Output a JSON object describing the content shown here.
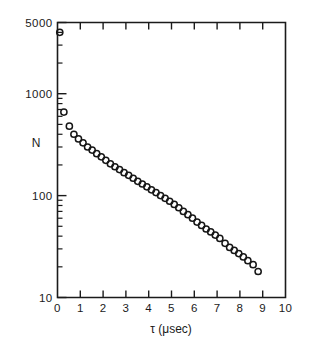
{
  "chart_data": {
    "type": "scatter",
    "title": "",
    "xlabel": "τ (μsec)",
    "ylabel": "N",
    "xlim": [
      0,
      10
    ],
    "ylim": [
      10,
      5000
    ],
    "yscale": "log",
    "xscale": "linear",
    "grid": false,
    "legend": null,
    "marker": "open-circle",
    "xticks": [
      0,
      1,
      2,
      3,
      4,
      5,
      6,
      7,
      8,
      9,
      10
    ],
    "xticklabels": [
      "0",
      "1",
      "2",
      "3",
      "4",
      "5",
      "6",
      "7",
      "8",
      "9",
      "10"
    ],
    "yticks": [
      10,
      100,
      1000,
      5000
    ],
    "yticklabels": [
      "10",
      "100",
      "1000",
      "5000"
    ],
    "y_minor_ticks": [
      20,
      30,
      40,
      50,
      60,
      70,
      80,
      90,
      200,
      300,
      400,
      500,
      600,
      700,
      800,
      900,
      2000,
      3000,
      4000
    ],
    "x": [
      0.1,
      0.28,
      0.52,
      0.72,
      0.92,
      1.12,
      1.32,
      1.52,
      1.72,
      1.92,
      2.12,
      2.32,
      2.52,
      2.72,
      2.92,
      3.12,
      3.32,
      3.52,
      3.72,
      3.92,
      4.12,
      4.32,
      4.52,
      4.72,
      4.92,
      5.12,
      5.32,
      5.52,
      5.72,
      5.92,
      6.12,
      6.32,
      6.52,
      6.72,
      6.92,
      7.12,
      7.35,
      7.55,
      7.75,
      7.95,
      8.15,
      8.35,
      8.58,
      8.8
    ],
    "y": [
      4000,
      660,
      480,
      400,
      360,
      330,
      300,
      280,
      258,
      240,
      222,
      205,
      192,
      180,
      168,
      158,
      148,
      138,
      130,
      122,
      114,
      107,
      100,
      94,
      88,
      82,
      76,
      70,
      65,
      60,
      55,
      51,
      47,
      44,
      41,
      38,
      34,
      31,
      29,
      27,
      25,
      23,
      21,
      18
    ],
    "series": [
      {
        "name": "N vs τ",
        "marker": "open-circle",
        "npoints": 44
      }
    ],
    "annotations": []
  },
  "figure": {
    "ylabel_text": "N",
    "xlabel_text": "τ (μsec)",
    "ytop_label": "5000",
    "ymid1_label": "1000",
    "ymid2_label": "100",
    "ybot_label": "10"
  }
}
